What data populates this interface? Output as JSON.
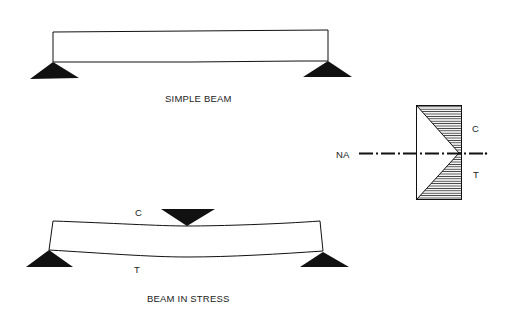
{
  "diagram": {
    "simple_beam": {
      "caption": "SIMPLE BEAM"
    },
    "beam_in_stress": {
      "caption": "BEAM IN STRESS",
      "top_label": "C",
      "bottom_label": "T"
    },
    "stress_distribution": {
      "neutral_axis_label": "NA",
      "compression_label": "C",
      "tension_label": "T"
    },
    "colors": {
      "ink": "#111111",
      "hatch": "#333333",
      "background": "#ffffff"
    }
  }
}
